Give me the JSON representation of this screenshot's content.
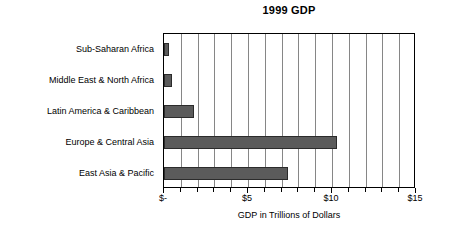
{
  "chart_data": {
    "type": "bar",
    "orientation": "horizontal",
    "title": "1999 GDP",
    "xlabel": "GDP in Trillions of Dollars",
    "ylabel": "",
    "categories": [
      "Sub-Saharan Africa",
      "Middle East & North Africa",
      "Latin America & Caribbean",
      "Europe & Central Asia",
      "East Asia & Pacific"
    ],
    "values": [
      0.3,
      0.5,
      1.8,
      10.3,
      7.4
    ],
    "xlim": [
      0,
      15
    ],
    "ylim": null,
    "grid": true,
    "gridline_interval": 1,
    "tick_values": [
      0,
      5,
      10,
      15
    ],
    "tick_labels": [
      "$-",
      "$5",
      "$10",
      "$15"
    ],
    "minor_tick_values": [
      1,
      2,
      3,
      4,
      6,
      7,
      8,
      9,
      11,
      12,
      13,
      14
    ],
    "legend": null,
    "legend_position": "none",
    "bar_color": "#5b5b5b",
    "bar_border_color": "#2b2b2b",
    "gridline_color": "#868686",
    "axis_color": "#000000",
    "background_color": "#ffffff"
  }
}
